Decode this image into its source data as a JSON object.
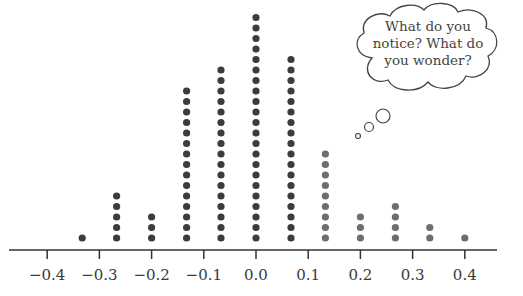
{
  "chart_data": {
    "type": "dot_plot",
    "title": "",
    "xlabel": "",
    "ylabel": "",
    "x_ticks": [
      -0.4,
      -0.3,
      -0.2,
      -0.1,
      0.0,
      0.1,
      0.2,
      0.3,
      0.4
    ],
    "x_tick_labels": [
      "−0.4",
      "−0.3",
      "−0.2",
      "−0.1",
      "0.0",
      "0.1",
      "0.2",
      "0.3",
      "0.4"
    ],
    "xlim": [
      -0.47,
      0.47
    ],
    "points": [
      {
        "x": -0.333,
        "count": 1
      },
      {
        "x": -0.267,
        "count": 5
      },
      {
        "x": -0.2,
        "count": 3
      },
      {
        "x": -0.133,
        "count": 15
      },
      {
        "x": -0.067,
        "count": 17
      },
      {
        "x": 0.0,
        "count": 22
      },
      {
        "x": 0.067,
        "count": 18
      },
      {
        "x": 0.133,
        "count": 9
      },
      {
        "x": 0.2,
        "count": 3
      },
      {
        "x": 0.267,
        "count": 4
      },
      {
        "x": 0.333,
        "count": 2
      },
      {
        "x": 0.4,
        "count": 1
      }
    ],
    "total": 100,
    "grid": false,
    "legend": null,
    "annotation": "What do you notice? What do you wonder?"
  },
  "colors": {
    "dark_dot": "#3c3c3c",
    "light_dot": "#6e6e6e",
    "axis": "#333333",
    "text": "#3a3a3a"
  },
  "thought_bubble": {
    "lines": [
      "What do you",
      "notice? What do",
      "you wonder?"
    ]
  }
}
